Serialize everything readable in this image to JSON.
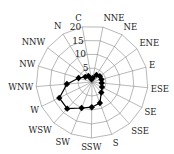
{
  "chart_data": {
    "type": "radar",
    "title": "",
    "directions": [
      "NNE",
      "NE",
      "ENE",
      "E",
      "ESE",
      "SE",
      "SSE",
      "S",
      "SSW",
      "SW",
      "WSW",
      "W",
      "WNW",
      "NW",
      "NNW",
      "N"
    ],
    "calm_label": "C",
    "values": [
      1.5,
      3,
      3.5,
      3.5,
      3.5,
      4,
      5,
      8,
      9,
      10,
      13,
      13,
      9,
      5,
      3,
      2.5
    ],
    "calm_value": 1,
    "radial_ticks": [
      5,
      10,
      15,
      20
    ],
    "rlim": [
      0,
      20
    ],
    "grid": true,
    "marker": "diamond",
    "line_color": "#000000",
    "grid_color": "#888888"
  },
  "labels": {
    "directions": [
      "NNE",
      "NE",
      "ENE",
      "E",
      "ESE",
      "SE",
      "SSE",
      "S",
      "SSW",
      "SW",
      "WSW",
      "W",
      "WNW",
      "NW",
      "NNW",
      "N"
    ],
    "calm": "C",
    "ticks": [
      "5",
      "10",
      "15",
      "20"
    ]
  }
}
